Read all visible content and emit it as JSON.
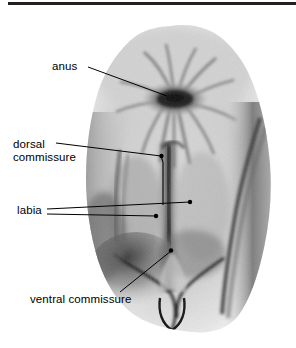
{
  "figure": {
    "kind": "anatomical-photograph-with-callouts",
    "background_color": "#ffffff",
    "ink_color": "#000000",
    "rule_color": "#231f20"
  },
  "top_rule": {
    "name": "page-rule",
    "visible": true
  },
  "labels": [
    {
      "id": "anus",
      "text": "anus",
      "lines": [
        "anus"
      ],
      "leader_count": 1,
      "endpoint_marker": "none"
    },
    {
      "id": "dorsal-commissure",
      "text": "dorsal commissure",
      "lines": [
        "dorsal",
        "commissure"
      ],
      "leader_count": 1,
      "endpoint_marker": "dot"
    },
    {
      "id": "labia",
      "text": "labia",
      "lines": [
        "labia"
      ],
      "leader_count": 2,
      "endpoint_marker": "dot"
    },
    {
      "id": "ventral-commissure",
      "text": "ventral commissure",
      "lines": [
        "ventral commissure"
      ],
      "leader_count": 1,
      "endpoint_marker": "dot"
    }
  ],
  "label_text": {
    "anus": "anus",
    "dorsal_line1": "dorsal",
    "dorsal_line2": "commissure",
    "labia": "labia",
    "ventral": "ventral commissure"
  }
}
